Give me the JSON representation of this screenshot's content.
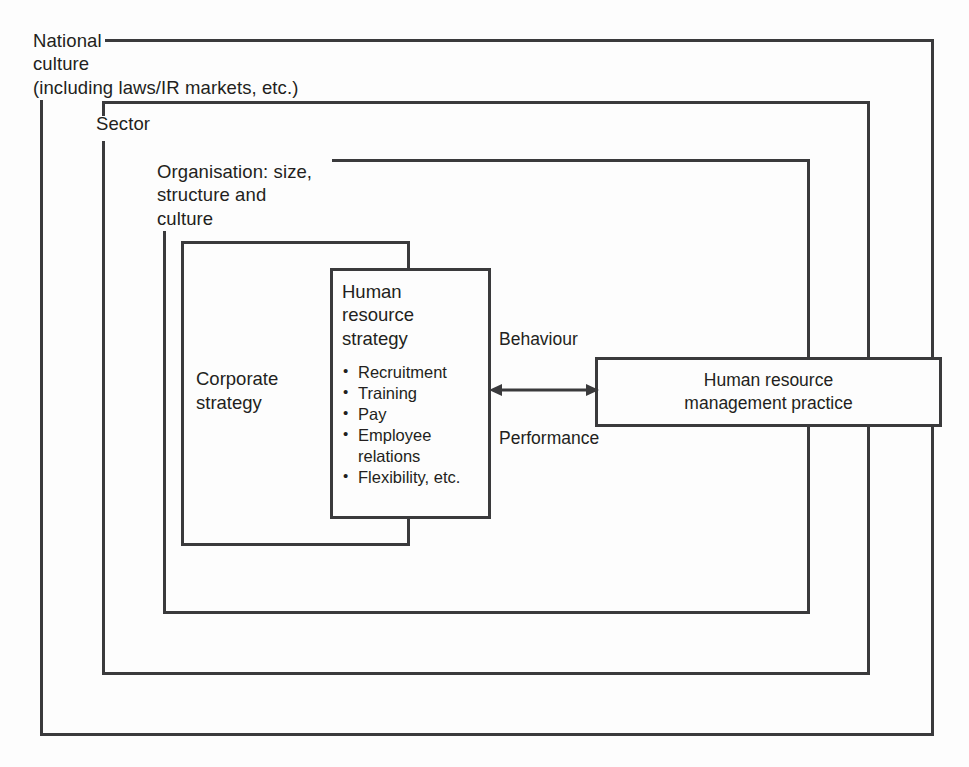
{
  "diagram": {
    "type": "nested-context-diagram",
    "background_color": "#fdfdfd",
    "line_color": "#3a3a3c",
    "text_color": "#231f20",
    "frames": [
      {
        "id": "national-culture",
        "label": "National\nculture\n(including laws/IR markets, etc.)"
      },
      {
        "id": "sector",
        "label": "Sector"
      },
      {
        "id": "organisation",
        "label": "Organisation: size,\nstructure and\nculture"
      }
    ],
    "boxes": {
      "corporate_strategy": {
        "label": "Corporate\nstrategy"
      },
      "human_resource_strategy": {
        "title": "Human\nresource\nstrategy",
        "items": [
          "Recruitment",
          "Training",
          "Pay",
          "Employee\nrelations",
          "Flexibility, etc."
        ]
      },
      "hrm_practice": {
        "label": "Human resource\nmanagement practice"
      }
    },
    "arrow": {
      "style": "double-headed-horizontal",
      "top_label": "Behaviour",
      "bottom_label": "Performance"
    }
  }
}
